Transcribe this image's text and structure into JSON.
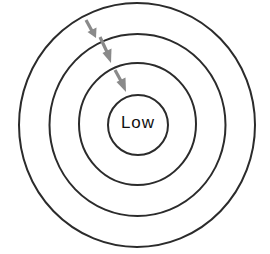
{
  "diagram": {
    "type": "concentric-circles",
    "center_label": "Low",
    "ring_count": 4,
    "colors": {
      "ring_stroke": "#2b2b2b",
      "arrow": "#8a8a8a",
      "text": "#111111",
      "background": "#ffffff"
    },
    "arrows": [
      {
        "name": "arrow-outer-to-second",
        "direction": "inward"
      },
      {
        "name": "arrow-second-to-third",
        "direction": "inward"
      },
      {
        "name": "arrow-third-to-inner",
        "direction": "inward"
      }
    ]
  }
}
